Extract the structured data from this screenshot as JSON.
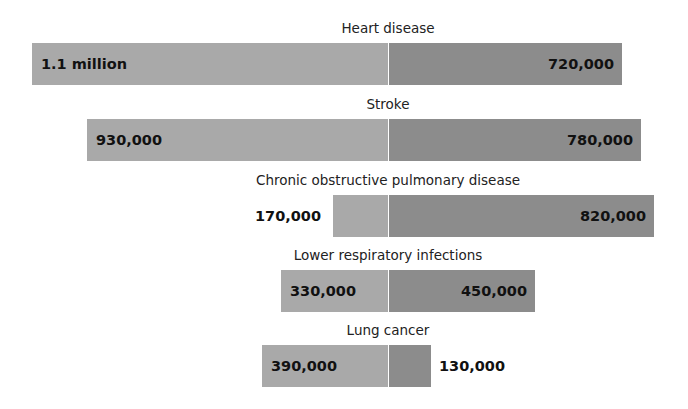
{
  "chart_data": {
    "type": "bar",
    "subtype": "diverging-horizontal",
    "title": "",
    "categories": [
      "Heart disease",
      "Stroke",
      "Chronic obstructive pulmonary disease",
      "Lower respiratory infections",
      "Lung cancer"
    ],
    "series": [
      {
        "name": "Left (lighter gray)",
        "color": "#a9a9a9",
        "values": [
          1100000,
          930000,
          170000,
          330000,
          390000
        ]
      },
      {
        "name": "Right (darker gray)",
        "color": "#8c8c8c",
        "values": [
          720000,
          780000,
          820000,
          450000,
          130000
        ]
      }
    ],
    "labels": {
      "left": [
        "1.1 million",
        "930,000",
        "170,000",
        "330,000",
        "390,000"
      ],
      "right": [
        "720,000",
        "780,000",
        "820,000",
        "450,000",
        "130,000"
      ]
    },
    "xlabel": "",
    "ylabel": "",
    "grid": false,
    "legend": null
  },
  "rows": [
    {
      "title": "Heart disease",
      "left_label": "1.1 million",
      "right_label": "720,000"
    },
    {
      "title": "Stroke",
      "left_label": "930,000",
      "right_label": "780,000"
    },
    {
      "title": "Chronic obstructive pulmonary disease",
      "left_label": "170,000",
      "right_label": "820,000"
    },
    {
      "title": "Lower respiratory infections",
      "left_label": "330,000",
      "right_label": "450,000"
    },
    {
      "title": "Lung cancer",
      "left_label": "390,000",
      "right_label": "130,000"
    }
  ]
}
